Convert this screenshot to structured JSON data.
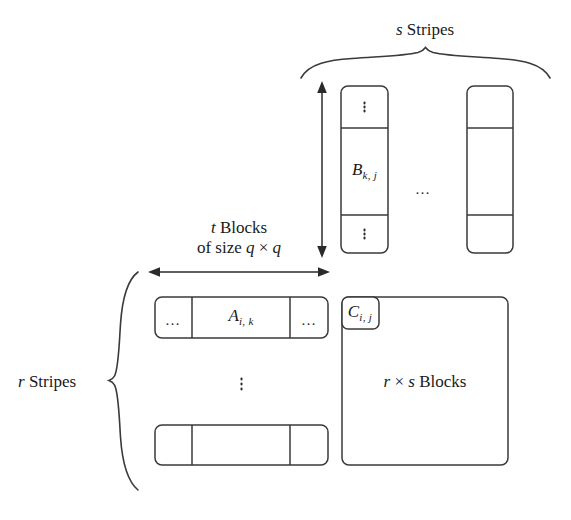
{
  "figure": {
    "title_top": "s Stripes",
    "title_top_var": "s",
    "title_top_rest": " Stripes",
    "title_left_var": "r",
    "title_left_rest": " Stripes",
    "t_blocks_line1_var": "t",
    "t_blocks_line1_rest": " Blocks",
    "t_blocks_line2": "of size q × q",
    "t_blocks_line2_prefix": "of size ",
    "t_blocks_line2_q1": "q",
    "t_blocks_line2_times": " × ",
    "t_blocks_line2_q2": "q",
    "stroke_color": "#3a3a3a",
    "text_color": "#1a1a1a",
    "background": "#ffffff"
  },
  "matrix_b": {
    "label": "B",
    "subscript": "k, j",
    "stripe1_cells": [
      {
        "content": "vertical-dots"
      },
      {
        "content": "B-label"
      },
      {
        "content": "vertical-dots"
      }
    ],
    "stripe2_cells": [
      {
        "content": "empty"
      },
      {
        "content": "empty"
      },
      {
        "content": "empty"
      }
    ],
    "between_stripes": "…"
  },
  "matrix_a": {
    "label": "A",
    "subscript": "i, k",
    "row1_cells": [
      {
        "text": "…"
      },
      {
        "text": "A-label"
      },
      {
        "text": "…"
      }
    ],
    "row2_cells": [
      {
        "text": ""
      },
      {
        "text": ""
      },
      {
        "text": ""
      }
    ],
    "between_rows": "vertical-dots"
  },
  "matrix_c": {
    "label": "C",
    "subscript": "i, j",
    "inner_text_var1": "r",
    "inner_text_times": " × ",
    "inner_text_var2": "s",
    "inner_text_rest": " Blocks"
  }
}
